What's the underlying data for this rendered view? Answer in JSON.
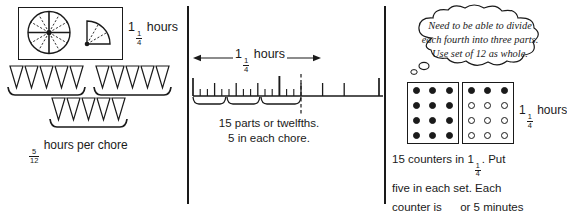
{
  "document": {
    "title": "Three representations of 1 1/4 hours divided into three chores",
    "ink_color": "#1a1a1a",
    "background_color": "#ffffff"
  },
  "panel1": {
    "name": "clock-model",
    "diagram": {
      "full_circle_sectors": 12,
      "quarter_circle_sectors": 3,
      "description": "circle divided into twelfths and a quarter circle divided into three parts"
    },
    "label": {
      "whole": "1",
      "numerator": "1",
      "denominator": "4",
      "unit": "hours"
    },
    "cone_rows": [
      {
        "count": 5
      },
      {
        "count": 5
      },
      {
        "count": 5
      }
    ],
    "caption": {
      "numerator": "5",
      "denominator": "12",
      "text": "hours per chore"
    }
  },
  "panel2": {
    "name": "number-line-model",
    "arrow_label": {
      "whole": "1",
      "numerator": "1",
      "denominator": "4",
      "unit": "hours"
    },
    "ruler": {
      "total_twelfths_marked": 15,
      "minor_ticks": 21,
      "quarter_ticks": 5,
      "whole_tick_position": "1",
      "dashed_end_marker": true,
      "brackets": 3,
      "bracket_span_twelfths": 5
    },
    "caption_line1": "15 parts or twelfths.",
    "caption_line2": "5 in each chore."
  },
  "panel3": {
    "name": "counters-model",
    "thought_bubble": "Need to be able to divide each fourth into three parts.  Use set of 12 as whole.",
    "counter_box_left": {
      "rows": 4,
      "columns": 3,
      "filled": 12,
      "hollow": 0
    },
    "counter_box_right": {
      "rows": 4,
      "columns": 3,
      "filled": 3,
      "hollow": 9
    },
    "label": {
      "whole": "1",
      "numerator": "1",
      "denominator": "4",
      "unit": "hours"
    },
    "caption": {
      "part1": "15 counters in 1",
      "frac1_num": "1",
      "frac1_den": "4",
      "part2": ".  Put",
      "line2": "five in each set.  Each",
      "part3": "counter is",
      "frac2_num": "1",
      "frac2_den": "12",
      "part4": "or 5 minutes"
    }
  }
}
